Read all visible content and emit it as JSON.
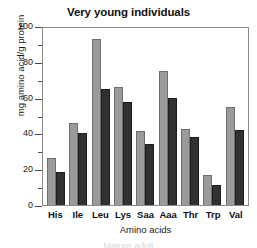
{
  "chart_data": {
    "type": "bar",
    "title": "Very young individuals",
    "xlabel": "Amino acids",
    "ylabel": "mg amino acid/g protein",
    "categories": [
      "His",
      "Ile",
      "Leu",
      "Lys",
      "Saa",
      "Aaa",
      "Thr",
      "Trp",
      "Val"
    ],
    "series": [
      {
        "name": "light-gray-series",
        "color": "#9a9a9a",
        "values": [
          26,
          46,
          93,
          66,
          41.5,
          75,
          42.5,
          17,
          55
        ]
      },
      {
        "name": "dark-gray-series",
        "color": "#313131",
        "values": [
          18.5,
          40,
          65,
          57.5,
          34,
          60,
          38,
          11,
          42
        ]
      }
    ],
    "ylim": [
      0,
      100
    ],
    "ytick_labels": [
      "100",
      "80",
      "60",
      "40",
      "20",
      "0"
    ],
    "ytick_values": [
      100,
      80,
      60,
      40,
      20,
      0
    ],
    "yminor_values": [
      90,
      70,
      50,
      30,
      10
    ],
    "grid": false,
    "legend": "none",
    "frame": true
  },
  "caption": {
    "clipped_line": "Mature adult"
  }
}
